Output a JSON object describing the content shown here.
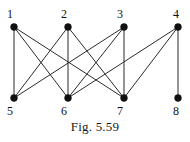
{
  "figure": {
    "caption": "Fig. 5.59",
    "type": "bipartite-graph-diagram"
  },
  "colors": {
    "edge": "#2b2b2b",
    "vertex": "#111111",
    "label": "#111111",
    "background": "#ffffff"
  },
  "graph": {
    "top_row_y": 27,
    "bottom_row_y": 98,
    "vertices": [
      {
        "id": "1",
        "label": "1",
        "x": 14,
        "y": 27,
        "label_x": 10,
        "label_y": 18,
        "row": "top"
      },
      {
        "id": "2",
        "label": "2",
        "x": 68,
        "y": 27,
        "label_x": 64,
        "label_y": 18,
        "row": "top"
      },
      {
        "id": "3",
        "label": "3",
        "x": 124,
        "y": 27,
        "label_x": 120,
        "label_y": 18,
        "row": "top"
      },
      {
        "id": "4",
        "label": "4",
        "x": 178,
        "y": 27,
        "label_x": 176,
        "label_y": 18,
        "row": "top"
      },
      {
        "id": "5",
        "label": "5",
        "x": 14,
        "y": 98,
        "label_x": 10,
        "label_y": 115,
        "row": "bottom"
      },
      {
        "id": "6",
        "label": "6",
        "x": 68,
        "y": 98,
        "label_x": 64,
        "label_y": 115,
        "row": "bottom"
      },
      {
        "id": "7",
        "label": "7",
        "x": 124,
        "y": 98,
        "label_x": 120,
        "label_y": 115,
        "row": "bottom"
      },
      {
        "id": "8",
        "label": "8",
        "x": 178,
        "y": 98,
        "label_x": 176,
        "label_y": 115,
        "row": "bottom"
      }
    ],
    "vertex_radius": 3.4,
    "edges": [
      {
        "from": "1",
        "to": "5",
        "x1": 14,
        "y1": 27,
        "x2": 14,
        "y2": 98
      },
      {
        "from": "1",
        "to": "6",
        "x1": 14,
        "y1": 27,
        "x2": 68,
        "y2": 98
      },
      {
        "from": "1",
        "to": "7",
        "x1": 14,
        "y1": 27,
        "x2": 124,
        "y2": 98
      },
      {
        "from": "2",
        "to": "5",
        "x1": 68,
        "y1": 27,
        "x2": 14,
        "y2": 98
      },
      {
        "from": "2",
        "to": "6",
        "x1": 68,
        "y1": 27,
        "x2": 68,
        "y2": 98
      },
      {
        "from": "2",
        "to": "7",
        "x1": 68,
        "y1": 27,
        "x2": 124,
        "y2": 98
      },
      {
        "from": "3",
        "to": "5",
        "x1": 124,
        "y1": 27,
        "x2": 14,
        "y2": 98
      },
      {
        "from": "3",
        "to": "6",
        "x1": 124,
        "y1": 27,
        "x2": 68,
        "y2": 98
      },
      {
        "from": "3",
        "to": "7",
        "x1": 124,
        "y1": 27,
        "x2": 124,
        "y2": 98
      },
      {
        "from": "4",
        "to": "6",
        "x1": 178,
        "y1": 27,
        "x2": 68,
        "y2": 98
      },
      {
        "from": "4",
        "to": "7",
        "x1": 178,
        "y1": 27,
        "x2": 124,
        "y2": 98
      },
      {
        "from": "4",
        "to": "8",
        "x1": 178,
        "y1": 27,
        "x2": 178,
        "y2": 98
      }
    ]
  }
}
